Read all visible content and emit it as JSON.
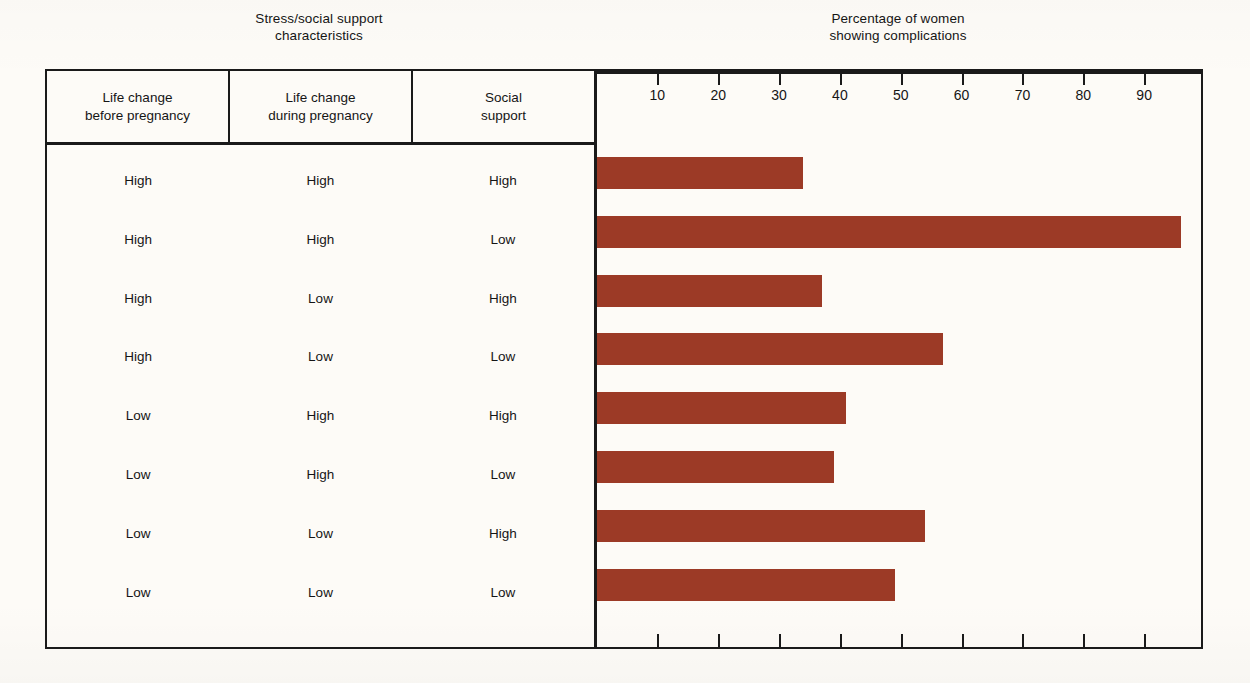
{
  "headers": {
    "left_group": {
      "line1": "Stress/social support",
      "line2": "characteristics"
    },
    "right_group": {
      "line1": "Percentage of women",
      "line2": "showing complications"
    }
  },
  "columns": [
    {
      "line1": "Life change",
      "line2": "before pregnancy"
    },
    {
      "line1": "Life change",
      "line2": "during pregnancy"
    },
    {
      "line1": "Social",
      "line2": "support"
    }
  ],
  "rows": [
    {
      "before": "High",
      "during": "High",
      "support": "High",
      "value": 34
    },
    {
      "before": "High",
      "during": "High",
      "support": "Low",
      "value": 96
    },
    {
      "before": "High",
      "during": "Low",
      "support": "High",
      "value": 37
    },
    {
      "before": "High",
      "during": "Low",
      "support": "Low",
      "value": 57
    },
    {
      "before": "Low",
      "during": "High",
      "support": "High",
      "value": 41
    },
    {
      "before": "Low",
      "during": "High",
      "support": "Low",
      "value": 39
    },
    {
      "before": "Low",
      "during": "Low",
      "support": "High",
      "value": 54
    },
    {
      "before": "Low",
      "during": "Low",
      "support": "Low",
      "value": 49
    }
  ],
  "axis": {
    "ticks": [
      10,
      20,
      30,
      40,
      50,
      60,
      70,
      80,
      90
    ],
    "min": 0,
    "max": 100
  },
  "colors": {
    "bar": "#9c3a26",
    "rule": "#1a1a1a",
    "paper": "#fdfbf7",
    "text": "#151515"
  },
  "chart_data": {
    "type": "bar",
    "orientation": "horizontal",
    "title": "Percentage of women showing complications",
    "xlabel": "Percentage of women showing complications",
    "ylabel": "Stress/social support characteristics",
    "xlim": [
      0,
      100
    ],
    "grid": false,
    "legend": "none",
    "tick_labels": [
      "10",
      "20",
      "30",
      "40",
      "50",
      "60",
      "70",
      "80",
      "90"
    ],
    "categories": [
      "High / High / High",
      "High / High / Low",
      "High / Low / High",
      "High / Low / Low",
      "Low / High / High",
      "Low / High / Low",
      "Low / Low / High",
      "Low / Low / Low"
    ],
    "values": [
      34,
      96,
      37,
      57,
      41,
      39,
      54,
      49
    ],
    "series": [
      {
        "name": "Percentage of women showing complications",
        "values": [
          34,
          96,
          37,
          57,
          41,
          39,
          54,
          49
        ]
      }
    ],
    "category_fields": [
      "Life change before pregnancy",
      "Life change during pregnancy",
      "Social support"
    ]
  }
}
